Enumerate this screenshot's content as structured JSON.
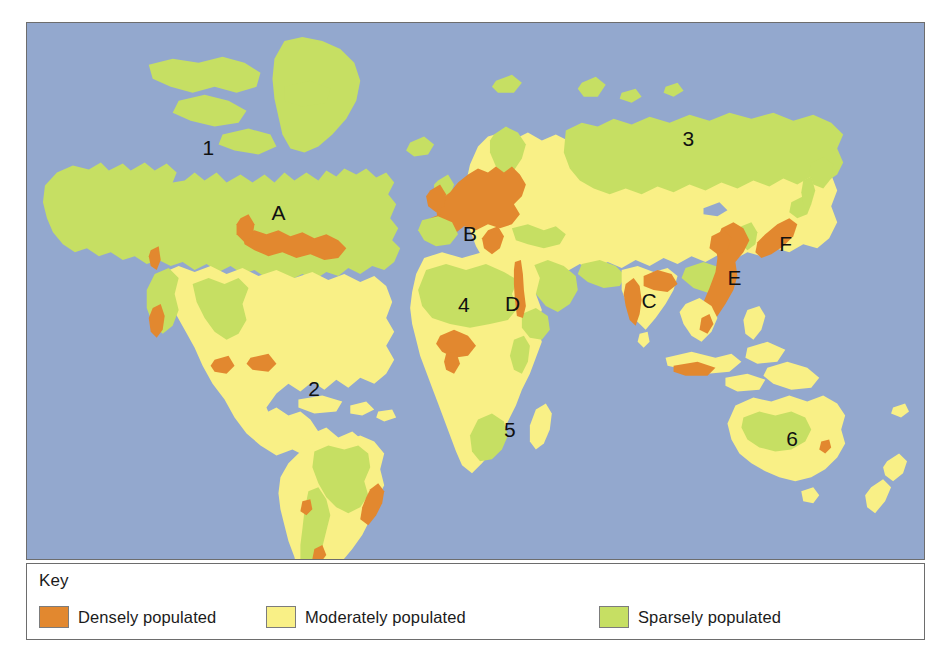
{
  "figure": {
    "type": "world-population-density-map",
    "background_color": "#ffffff"
  },
  "map": {
    "ocean_color": "#93a8ce",
    "border_color": "#6d6d6d",
    "labels": [
      {
        "id": "label-1",
        "text": "1",
        "x": 176,
        "y": 133,
        "region": "northern-canada"
      },
      {
        "id": "label-A",
        "text": "A",
        "x": 245,
        "y": 198,
        "region": "us-northeast"
      },
      {
        "id": "label-2",
        "text": "2",
        "x": 282,
        "y": 374,
        "region": "amazon-basin"
      },
      {
        "id": "label-B",
        "text": "B",
        "x": 437,
        "y": 219,
        "region": "western-europe"
      },
      {
        "id": "label-4",
        "text": "4",
        "x": 432,
        "y": 290,
        "region": "sahara"
      },
      {
        "id": "label-D",
        "text": "D",
        "x": 479,
        "y": 289,
        "region": "nile-valley"
      },
      {
        "id": "label-5",
        "text": "5",
        "x": 478,
        "y": 416,
        "region": "southern-africa"
      },
      {
        "id": "label-3",
        "text": "3",
        "x": 657,
        "y": 123,
        "region": "siberia"
      },
      {
        "id": "label-C",
        "text": "C",
        "x": 616,
        "y": 286,
        "region": "india"
      },
      {
        "id": "label-E",
        "text": "E",
        "x": 702,
        "y": 263,
        "region": "eastern-china"
      },
      {
        "id": "label-F",
        "text": "F",
        "x": 754,
        "y": 229,
        "region": "japan"
      },
      {
        "id": "label-6",
        "text": "6",
        "x": 761,
        "y": 425,
        "region": "australia"
      }
    ]
  },
  "key": {
    "title": "Key",
    "items": [
      {
        "id": "dense",
        "label": "Densely populated",
        "color": "#e2882f"
      },
      {
        "id": "moderate",
        "label": "Moderately populated",
        "color": "#f9f086"
      },
      {
        "id": "sparse",
        "label": "Sparsely populated",
        "color": "#c6df63"
      }
    ]
  },
  "colors": {
    "ocean": "#93a8ce",
    "dense": "#e2882f",
    "moderate": "#f9f086",
    "sparse": "#c6df63",
    "outline": "#6d6d6d",
    "text": "#1b1b1b"
  }
}
